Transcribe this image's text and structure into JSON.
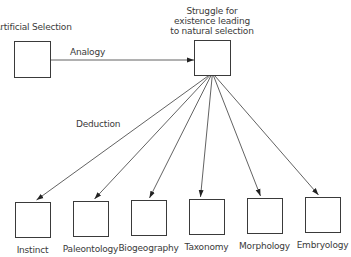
{
  "diagram": {
    "source_node": {
      "id": "artificial-selection",
      "label": "Artificial Selection",
      "box": {
        "x": 14,
        "y": 41,
        "w": 36,
        "h": 36
      }
    },
    "hub_node": {
      "id": "struggle",
      "label_lines": [
        "Struggle for",
        "existence leading",
        "to natural selection"
      ],
      "box": {
        "x": 194,
        "y": 40,
        "w": 36,
        "h": 35
      }
    },
    "edges": {
      "analogy": {
        "label": "Analogy",
        "from": "artificial-selection",
        "to": "struggle"
      },
      "deduction": {
        "label": "Deduction",
        "from": "struggle",
        "to": "all-bottom-nodes"
      }
    },
    "bottom_nodes": [
      {
        "id": "instinct",
        "label": "Instinct",
        "box": {
          "x": 15,
          "y": 202,
          "w": 35,
          "h": 35
        }
      },
      {
        "id": "paleontology",
        "label": "Paleontology",
        "box": {
          "x": 73,
          "y": 201,
          "w": 35,
          "h": 35
        }
      },
      {
        "id": "biogeography",
        "label": "Biogeography",
        "box": {
          "x": 131,
          "y": 200,
          "w": 35,
          "h": 35
        }
      },
      {
        "id": "taxonomy",
        "label": "Taxonomy",
        "box": {
          "x": 189,
          "y": 199,
          "w": 35,
          "h": 35
        }
      },
      {
        "id": "morphology",
        "label": "Morphology",
        "box": {
          "x": 247,
          "y": 198,
          "w": 35,
          "h": 35
        }
      },
      {
        "id": "embryology",
        "label": "Embryology",
        "box": {
          "x": 305,
          "y": 197,
          "w": 35,
          "h": 35
        }
      }
    ],
    "colors": {
      "stroke": "#3a3a3a",
      "arrow": "#222222",
      "text": "#3a3a3a"
    }
  }
}
